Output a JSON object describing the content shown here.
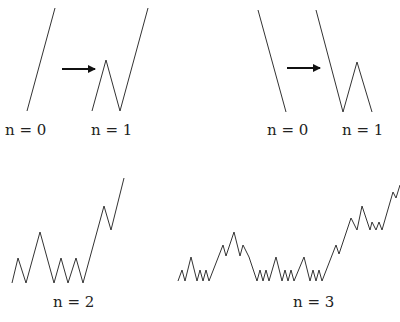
{
  "figure": {
    "line_color": "#333333",
    "arrow_color": "#111111",
    "panels": [
      {
        "id": "left-n0",
        "label": "n = 0",
        "label_pos": [
          5,
          121
        ],
        "points": [
          [
            27,
            111
          ],
          [
            55,
            8
          ]
        ]
      },
      {
        "id": "left-n1",
        "label": "n = 1",
        "label_pos": [
          91,
          121
        ],
        "points": [
          [
            92,
            111
          ],
          [
            106,
            60
          ],
          [
            120,
            111
          ],
          [
            148,
            8
          ]
        ]
      },
      {
        "id": "right-n0",
        "label": "n = 0",
        "label_pos": [
          267,
          121
        ],
        "points": [
          [
            258,
            10
          ],
          [
            286,
            112
          ]
        ]
      },
      {
        "id": "right-n1",
        "label": "n = 1",
        "label_pos": [
          342,
          121
        ],
        "points": [
          [
            316,
            10
          ],
          [
            343,
            112
          ],
          [
            357,
            62
          ],
          [
            372,
            112
          ]
        ]
      },
      {
        "id": "n2",
        "label": "n = 2",
        "label_pos": [
          53,
          293
        ],
        "points": [
          [
            12,
            283
          ],
          [
            18,
            258
          ],
          [
            26,
            283
          ],
          [
            40,
            232
          ],
          [
            54,
            283
          ],
          [
            61,
            258
          ],
          [
            68,
            283
          ],
          [
            76,
            258
          ],
          [
            83,
            283
          ],
          [
            104,
            206
          ],
          [
            111,
            230
          ],
          [
            124,
            178
          ]
        ]
      },
      {
        "id": "n3",
        "label": "n = 3",
        "label_pos": [
          293,
          293
        ],
        "points": [
          [
            178,
            281
          ],
          [
            182,
            270
          ],
          [
            185,
            281
          ],
          [
            191,
            257
          ],
          [
            197,
            281
          ],
          [
            200,
            270
          ],
          [
            203,
            281
          ],
          [
            206,
            270
          ],
          [
            209,
            281
          ],
          [
            223,
            245
          ],
          [
            226,
            256
          ],
          [
            234,
            232
          ],
          [
            240,
            256
          ],
          [
            243,
            245
          ],
          [
            249,
            257
          ],
          [
            257,
            281
          ],
          [
            260,
            270
          ],
          [
            263,
            281
          ],
          [
            266,
            270
          ],
          [
            269,
            281
          ],
          [
            276,
            257
          ],
          [
            282,
            281
          ],
          [
            285,
            270
          ],
          [
            288,
            281
          ],
          [
            291,
            270
          ],
          [
            294,
            281
          ],
          [
            304,
            257
          ],
          [
            310,
            281
          ],
          [
            313,
            270
          ],
          [
            316,
            281
          ],
          [
            319,
            270
          ],
          [
            322,
            281
          ],
          [
            336,
            245
          ],
          [
            339,
            254
          ],
          [
            351,
            218
          ],
          [
            357,
            230
          ],
          [
            362,
            206
          ],
          [
            370,
            230
          ],
          [
            372,
            222
          ],
          [
            376,
            230
          ],
          [
            379,
            222
          ],
          [
            382,
            230
          ],
          [
            393,
            192
          ],
          [
            396,
            198
          ],
          [
            400,
            185
          ]
        ]
      }
    ],
    "arrows": [
      {
        "id": "left-arrow",
        "from": [
          62,
          69
        ],
        "to": [
          95,
          69
        ]
      },
      {
        "id": "right-arrow",
        "from": [
          287,
          68
        ],
        "to": [
          320,
          68
        ]
      }
    ]
  }
}
